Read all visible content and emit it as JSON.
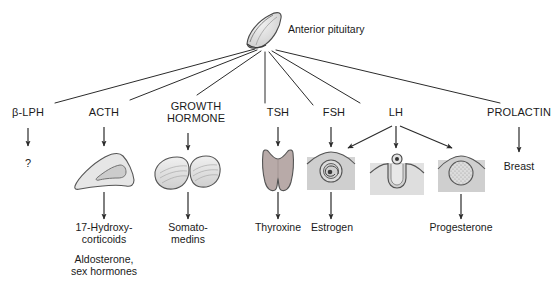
{
  "diagram": {
    "source_gland": {
      "name": "Anterior pituitary",
      "label": "Anterior pituitary",
      "icon": "pituitary-gland-icon"
    },
    "colors": {
      "line": "#2b2b2b",
      "text": "#1a1a1a",
      "background": "#ffffff",
      "organ_fill_light": "#e8e8e8",
      "organ_fill_gray": "#d0d0d0",
      "organ_stroke": "#555555",
      "thyroid_fill": "#b8aaa8",
      "tissue_box_fill": "#d4d4d4",
      "tissue_box_fill_light": "#e2e2e2"
    },
    "hormones": [
      {
        "id": "b-lph",
        "label": "β-LPH",
        "target_icon": "none",
        "target_label": "?",
        "products": []
      },
      {
        "id": "acth",
        "label": "ACTH",
        "target_icon": "adrenal-gland-icon",
        "target_label": "",
        "products": [
          "17-Hydroxy-\ncorticoids",
          "Aldosterone,\nsex hormones"
        ]
      },
      {
        "id": "growth-hormone",
        "label": "GROWTH\nHORMONE",
        "target_icon": "liver-icon",
        "target_label": "",
        "products": [
          "Somato-\nmedins"
        ]
      },
      {
        "id": "tsh",
        "label": "TSH",
        "target_icon": "thyroid-gland-icon",
        "target_label": "",
        "products": [
          "Thyroxine"
        ]
      },
      {
        "id": "fsh",
        "label": "FSH",
        "target_icon": "ovarian-follicle-icon",
        "target_label": "",
        "products": [
          "Estrogen"
        ]
      },
      {
        "id": "lh",
        "label": "LH",
        "target_icon": "ovulation-icon",
        "target_label": "",
        "products": [
          "Progesterone"
        ]
      },
      {
        "id": "prolactin",
        "label": "PROLACTIN",
        "target_icon": "none",
        "target_label": "Breast",
        "products": []
      }
    ],
    "targets": [
      {
        "id": "unknown-target",
        "label": "?"
      },
      {
        "id": "adrenal-gland",
        "label": ""
      },
      {
        "id": "liver",
        "label": ""
      },
      {
        "id": "thyroid",
        "label": ""
      },
      {
        "id": "follicle",
        "label": ""
      },
      {
        "id": "ovulation",
        "label": ""
      },
      {
        "id": "corpus-luteum",
        "label": ""
      },
      {
        "id": "breast",
        "label": "Breast"
      }
    ],
    "products": [
      {
        "id": "hydroxycorticoids-line1",
        "label": "17-Hydroxy-"
      },
      {
        "id": "hydroxycorticoids-line2",
        "label": "corticoids"
      },
      {
        "id": "aldosterone-line1",
        "label": "Aldosterone,"
      },
      {
        "id": "aldosterone-line2",
        "label": "sex hormones"
      },
      {
        "id": "somatomedins-line1",
        "label": "Somato-"
      },
      {
        "id": "somatomedins-line2",
        "label": "medins"
      },
      {
        "id": "thyroxine",
        "label": "Thyroxine"
      },
      {
        "id": "estrogen",
        "label": "Estrogen"
      },
      {
        "id": "progesterone",
        "label": "Progesterone"
      }
    ]
  }
}
